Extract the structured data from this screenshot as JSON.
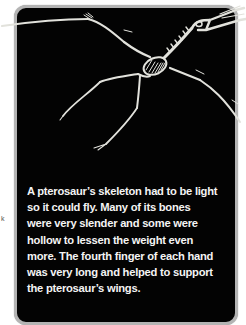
{
  "figure": {
    "panel_background": "#030303",
    "panel_border": "#b4b4b4",
    "bone_color": "#e2e2dc"
  },
  "caption": {
    "lines": [
      "A pterosaur’s skeleton had to be light",
      "so it could fly. Many of its bones",
      "were very slender and some were",
      "hollow to lessen the weight even",
      "more. The fourth finger of each hand",
      "was very long and helped to support",
      "the pterosaur’s wings."
    ]
  },
  "margin": {
    "stray_mark": "k"
  }
}
